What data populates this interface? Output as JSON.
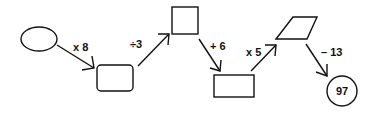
{
  "diagram": {
    "type": "function-machine-flow",
    "nodes": [
      {
        "id": "start",
        "shape": "ellipse",
        "value": ""
      },
      {
        "id": "box1",
        "shape": "rounded-rectangle",
        "value": ""
      },
      {
        "id": "box2",
        "shape": "square",
        "value": ""
      },
      {
        "id": "box3",
        "shape": "rectangle",
        "value": ""
      },
      {
        "id": "box4",
        "shape": "parallelogram",
        "value": ""
      },
      {
        "id": "end",
        "shape": "circle",
        "value": "97"
      }
    ],
    "operations": [
      {
        "from": "start",
        "to": "box1",
        "label": "x 8"
      },
      {
        "from": "box1",
        "to": "box2",
        "label": "÷3"
      },
      {
        "from": "box2",
        "to": "box3",
        "label": "+ 6"
      },
      {
        "from": "box3",
        "to": "box4",
        "label": "x 5"
      },
      {
        "from": "box4",
        "to": "end",
        "label": "– 13"
      }
    ]
  }
}
